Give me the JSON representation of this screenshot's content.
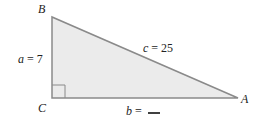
{
  "diagram": {
    "type": "right-triangle",
    "vertices": {
      "B": "B",
      "C": "C",
      "A": "A"
    },
    "sides": {
      "a": {
        "var": "a",
        "eq": " = ",
        "value": "7"
      },
      "c": {
        "var": "c",
        "eq": " = ",
        "value": "25"
      },
      "b": {
        "var": "b",
        "eq": " = ",
        "value": ""
      }
    },
    "colors": {
      "fill": "#ebebeb",
      "stroke": "#8a8a8a"
    }
  }
}
